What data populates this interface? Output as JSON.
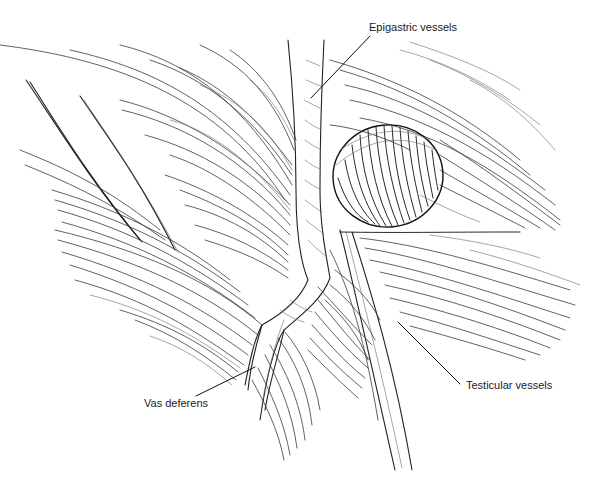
{
  "figure": {
    "type": "anatomical line drawing"
  },
  "labels": {
    "epigastric": "Epigastric vessels",
    "vas": "Vas deferens",
    "testicular": "Testicular vessels"
  },
  "colors": {
    "ink": "#2a2a2a",
    "background": "#ffffff"
  }
}
